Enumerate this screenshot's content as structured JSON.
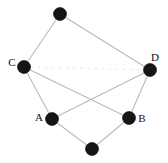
{
  "figure": {
    "type": "undirected-graph-diagram",
    "background_color": "#ffffff",
    "width": 168,
    "height": 163
  },
  "style": {
    "node_fill": "#151515",
    "node_stroke": "#000000",
    "node_radius": 6.5,
    "edge_color": "#b9b9b9",
    "edge_faint_color": "#e2e2e2",
    "edge_width": 1.1,
    "label_color": "#111111",
    "label_font_size": 11
  },
  "nodes": [
    {
      "id": "top",
      "label": "",
      "x": 60,
      "y": 14,
      "label_x": 60,
      "label_y": 14,
      "has_label": false
    },
    {
      "id": "C",
      "label": "C",
      "x": 24,
      "y": 67,
      "label_x": 12,
      "label_y": 63,
      "has_label": true
    },
    {
      "id": "D",
      "label": "D",
      "x": 150,
      "y": 70,
      "label_x": 155,
      "label_y": 58,
      "has_label": true
    },
    {
      "id": "A",
      "label": "A",
      "x": 52,
      "y": 119,
      "label_x": 39,
      "label_y": 118,
      "has_label": true
    },
    {
      "id": "B",
      "label": "B",
      "x": 129,
      "y": 118,
      "label_x": 142,
      "label_y": 119,
      "has_label": true
    },
    {
      "id": "bottom",
      "label": "",
      "x": 92,
      "y": 149,
      "label_x": 92,
      "label_y": 149,
      "has_label": false
    }
  ],
  "edges": [
    {
      "id": "edge-top-C",
      "from": "top",
      "to": "C",
      "faint": false
    },
    {
      "id": "edge-top-D",
      "from": "top",
      "to": "D",
      "faint": false
    },
    {
      "id": "edge-C-A",
      "from": "C",
      "to": "A",
      "faint": false
    },
    {
      "id": "edge-C-B",
      "from": "C",
      "to": "B",
      "faint": false
    },
    {
      "id": "edge-D-A",
      "from": "D",
      "to": "A",
      "faint": false
    },
    {
      "id": "edge-D-B",
      "from": "D",
      "to": "B",
      "faint": false
    },
    {
      "id": "edge-A-bottom",
      "from": "A",
      "to": "bottom",
      "faint": false
    },
    {
      "id": "edge-B-bottom",
      "from": "B",
      "to": "bottom",
      "faint": false
    },
    {
      "id": "edge-C-D-faint",
      "from": "C",
      "to": "D",
      "faint": true
    }
  ],
  "labels": {
    "A": "A",
    "B": "B",
    "C": "C",
    "D": "D"
  }
}
